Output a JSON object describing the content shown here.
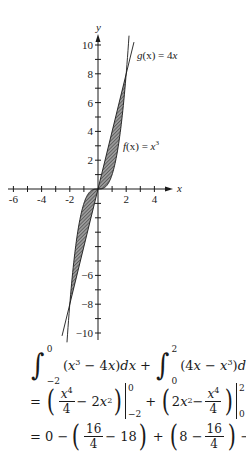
{
  "chart_data": {
    "type": "line",
    "title": "",
    "xlabel": "x",
    "ylabel": "y",
    "xlim": [
      -6.5,
      5.3
    ],
    "ylim": [
      -10.5,
      10.3
    ],
    "x_ticks": [
      -6,
      -5,
      -4,
      -3,
      -2,
      -1,
      1,
      2,
      3,
      4
    ],
    "x_tick_labels": [
      "-6",
      "-4",
      "-2",
      "2",
      "4"
    ],
    "x_labeled_ticks": [
      -6,
      -4,
      -2,
      2,
      4
    ],
    "y_ticks": [
      -10,
      -9,
      -8,
      -7,
      -6,
      -5,
      -4,
      -3,
      -2,
      -1,
      1,
      2,
      3,
      4,
      5,
      6,
      7,
      8,
      9,
      10
    ],
    "y_tick_labels": [
      "10",
      "8",
      "6",
      "4",
      "2",
      "-6",
      "-8",
      "-10"
    ],
    "y_labeled_ticks": [
      10,
      8,
      6,
      4,
      2,
      -6,
      -8,
      -10
    ],
    "grid": false,
    "series": [
      {
        "name": "g(x) = 4x",
        "expression": "4x",
        "x_range": [
          -2.55,
          2.55
        ]
      },
      {
        "name": "f(x) = x^3",
        "expression": "x^3",
        "x_range": [
          -2.2,
          2.2
        ]
      }
    ],
    "shaded_regions": [
      {
        "between": [
          "f(x) = x^3",
          "g(x) = 4x"
        ],
        "x_range": [
          -2,
          0
        ],
        "upper": "x^3",
        "lower": "4x"
      },
      {
        "between": [
          "g(x) = 4x",
          "f(x) = x^3"
        ],
        "x_range": [
          0,
          2
        ],
        "upper": "4x",
        "lower": "x^3"
      }
    ],
    "intersections": [
      [
        -2,
        -8
      ],
      [
        0,
        0
      ],
      [
        2,
        8
      ]
    ],
    "annotations": [
      {
        "text": "g(x) = 4x",
        "near": [
          2.5,
          10
        ]
      },
      {
        "text": "f(x) = x³",
        "near": [
          2.2,
          3
        ]
      }
    ]
  },
  "labels": {
    "axis_x": "x",
    "axis_y": "y",
    "g_label_name": "g",
    "g_label_arg": "(x) = 4",
    "g_label_var": "x",
    "f_label_name": "f",
    "f_label_arg": "(x) = ",
    "f_label_var": "x",
    "f_label_exp": "3"
  },
  "equations": {
    "line1": {
      "int1_upper": "0",
      "int1_lower": "−2",
      "int1_integrand_open": "(",
      "int1_x": "x",
      "int1_exp": "3",
      "int1_rest": " − 4",
      "int1_x2": "x",
      "int1_close": ")",
      "int1_d": "d",
      "int1_dx": "x",
      "plus": "+",
      "int2_upper": "2",
      "int2_lower": "0",
      "int2_open": "(4",
      "int2_x": "x",
      "int2_minus": " − ",
      "int2_x2": "x",
      "int2_exp": "3",
      "int2_close": ")",
      "int2_d": "d",
      "int2_dx": "x"
    },
    "line2": {
      "eq": "=",
      "frac1_num_x": "x",
      "frac1_num_exp": "4",
      "frac1_den": "4",
      "term1_mid": " − 2",
      "term1_x": "x",
      "term1_exp": "2",
      "eval1_upper": "0",
      "eval1_lower": "−2",
      "plus": "+",
      "term2_lead": "2",
      "term2_x": "x",
      "term2_exp": "2",
      "term2_minus": " − ",
      "frac2_num_x": "x",
      "frac2_num_exp": "4",
      "frac2_den": "4",
      "eval2_upper": "2",
      "eval2_lower": "0"
    },
    "line3": {
      "eq": "= 0 −",
      "frac1_num": "16",
      "frac1_den": "4",
      "after_frac1": " − 18",
      "plus": "+",
      "before_frac2": "8 − ",
      "frac2_num": "16",
      "frac2_den": "4",
      "tail": "− 0 = 8"
    }
  },
  "colors": {
    "ink": "#1a1a1a",
    "shade": "#6e6e6e",
    "background": "#ffffff"
  }
}
